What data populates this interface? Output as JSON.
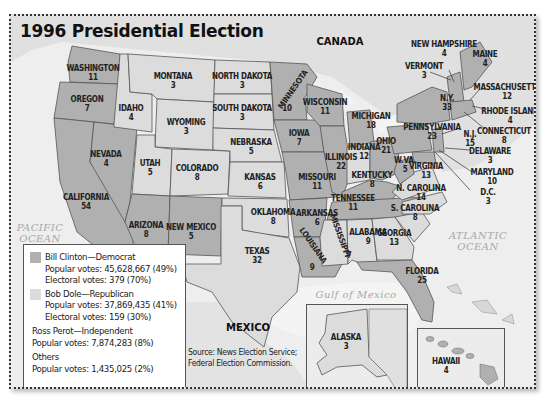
{
  "title": "1996 Presidential Election",
  "colors": {
    "clinton": "#b0b0b0",
    "dole": "#dcdcdc",
    "water": "#f2f2f2",
    "land": "#e2e2e2",
    "border": "#555555"
  },
  "labels": {
    "canada": "CANADA",
    "mexico": "MEXICO",
    "pacific": "PACIFIC OCEAN",
    "pacific_1": "PACIFIC",
    "pacific_2": "OCEAN",
    "atlantic_1": "ATLANTIC",
    "atlantic_2": "OCEAN",
    "gulf": "Gulf of Mexico"
  },
  "states": {
    "WA": {
      "name": "WASHINGTON",
      "ev": "11",
      "winner": "Clinton"
    },
    "OR": {
      "name": "OREGON",
      "ev": "7",
      "winner": "Clinton"
    },
    "CA": {
      "name": "CALIFORNIA",
      "ev": "54",
      "winner": "Clinton"
    },
    "NV": {
      "name": "NEVADA",
      "ev": "4",
      "winner": "Clinton"
    },
    "ID": {
      "name": "IDAHO",
      "ev": "4",
      "winner": "Dole"
    },
    "MT": {
      "name": "MONTANA",
      "ev": "3",
      "winner": "Dole"
    },
    "WY": {
      "name": "WYOMING",
      "ev": "3",
      "winner": "Dole"
    },
    "UT": {
      "name": "UTAH",
      "ev": "5",
      "winner": "Dole"
    },
    "CO": {
      "name": "COLORADO",
      "ev": "8",
      "winner": "Dole"
    },
    "AZ": {
      "name": "ARIZONA",
      "ev": "8",
      "winner": "Clinton"
    },
    "NM": {
      "name": "NEW MEXICO",
      "ev": "5",
      "winner": "Clinton"
    },
    "ND": {
      "name": "NORTH DAKOTA",
      "ev": "3",
      "winner": "Dole"
    },
    "SD": {
      "name": "SOUTH DAKOTA",
      "ev": "3",
      "winner": "Dole"
    },
    "NE": {
      "name": "NEBRASKA",
      "ev": "5",
      "winner": "Dole"
    },
    "KS": {
      "name": "KANSAS",
      "ev": "6",
      "winner": "Dole"
    },
    "OK": {
      "name": "OKLAHOMA",
      "ev": "8",
      "winner": "Dole"
    },
    "TX": {
      "name": "TEXAS",
      "ev": "32",
      "winner": "Dole"
    },
    "MN": {
      "name": "MINNESOTA",
      "ev": "10",
      "winner": "Clinton"
    },
    "IA": {
      "name": "IOWA",
      "ev": "7",
      "winner": "Clinton"
    },
    "MO": {
      "name": "MISSOURI",
      "ev": "11",
      "winner": "Clinton"
    },
    "AR": {
      "name": "ARKANSAS",
      "ev": "6",
      "winner": "Clinton"
    },
    "LA": {
      "name": "LOUISIANA",
      "ev": "9",
      "winner": "Clinton"
    },
    "WI": {
      "name": "WISCONSIN",
      "ev": "11",
      "winner": "Clinton"
    },
    "IL": {
      "name": "ILLINOIS",
      "ev": "22",
      "winner": "Clinton"
    },
    "MI": {
      "name": "MICHIGAN",
      "ev": "18",
      "winner": "Clinton"
    },
    "IN": {
      "name": "INDIANA",
      "ev": "12",
      "winner": "Dole"
    },
    "OH": {
      "name": "OHIO",
      "ev": "21",
      "winner": "Clinton"
    },
    "KY": {
      "name": "KENTUCKY",
      "ev": "8",
      "winner": "Clinton"
    },
    "TN": {
      "name": "TENNESSEE",
      "ev": "11",
      "winner": "Clinton"
    },
    "MS": {
      "name": "MISSISSIPPI",
      "ev": "7",
      "winner": "Dole"
    },
    "AL": {
      "name": "ALABAMA",
      "ev": "9",
      "winner": "Dole"
    },
    "GA": {
      "name": "GEORGIA",
      "ev": "13",
      "winner": "Dole"
    },
    "FL": {
      "name": "FLORIDA",
      "ev": "25",
      "winner": "Clinton"
    },
    "SC": {
      "name": "S. CAROLINA",
      "ev": "8",
      "winner": "Dole"
    },
    "NC": {
      "name": "N. CAROLINA",
      "ev": "14",
      "winner": "Dole"
    },
    "VA": {
      "name": "VIRGINIA",
      "ev": "13",
      "winner": "Dole"
    },
    "WV": {
      "name": "W.VA.",
      "ev": "5",
      "winner": "Clinton"
    },
    "PA": {
      "name": "PENNSYLVANIA",
      "ev": "23",
      "winner": "Clinton"
    },
    "NY": {
      "name": "N.Y.",
      "ev": "33",
      "winner": "Clinton"
    },
    "VT": {
      "name": "VERMONT",
      "ev": "3",
      "winner": "Clinton"
    },
    "NH": {
      "name": "NEW HAMPSHIRE",
      "ev": "4",
      "winner": "Clinton"
    },
    "ME": {
      "name": "MAINE",
      "ev": "4",
      "winner": "Clinton"
    },
    "MA": {
      "name": "MASSACHUSETTS",
      "ev": "12",
      "winner": "Clinton"
    },
    "RI": {
      "name": "RHODE ISLAND",
      "ev": "4",
      "winner": "Clinton"
    },
    "CT": {
      "name": "CONNECTICUT",
      "ev": "8",
      "winner": "Clinton"
    },
    "NJ": {
      "name": "N.J.",
      "ev": "15",
      "winner": "Clinton"
    },
    "DE": {
      "name": "DELAWARE",
      "ev": "3",
      "winner": "Clinton"
    },
    "MD": {
      "name": "MARYLAND",
      "ev": "10",
      "winner": "Clinton"
    },
    "DC": {
      "name": "D.C.",
      "ev": "3",
      "winner": "Clinton"
    },
    "AK": {
      "name": "ALASKA",
      "ev": "3",
      "winner": "Dole"
    },
    "HI": {
      "name": "HAWAII",
      "ev": "4",
      "winner": "Clinton"
    }
  },
  "legend": {
    "clinton_name": "Bill Clinton—Democrat",
    "clinton_popular": "Popular votes: 45,628,667 (49%)",
    "clinton_electoral": "Electoral votes: 379 (70%)",
    "dole_name": "Bob Dole—Republican",
    "dole_popular": "Popular votes: 37,869,435 (41%)",
    "dole_electoral": "Electoral votes: 159 (30%)",
    "perot_name": "Ross Perot—Independent",
    "perot_popular": "Popular votes: 7,874,283 (8%)",
    "others_name": "Others",
    "others_popular": "Popular votes: 1,435,025 (2%)"
  },
  "source": {
    "line1": "Source: News Election Service;",
    "line2": "Federal Election Commission."
  }
}
